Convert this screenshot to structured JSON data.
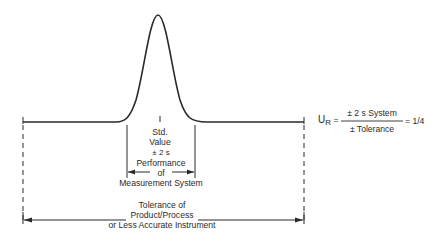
{
  "diagram": {
    "center_label": [
      "Std.",
      "Value"
    ],
    "inner_range_label": [
      "± 2 s",
      "Performance",
      "of",
      "Measurement System"
    ],
    "outer_range_label": [
      "Tolerance of",
      "Product/Process",
      "or Less Accurate Instrument"
    ],
    "formula": {
      "lhs": "U",
      "lhs_subscript": "R",
      "equals": "=",
      "numerator": "± 2 s System",
      "denominator": "± Tolerance",
      "result": "= 1/4"
    },
    "colors": {
      "line": "#2a2a2a",
      "background": "#ffffff"
    }
  }
}
